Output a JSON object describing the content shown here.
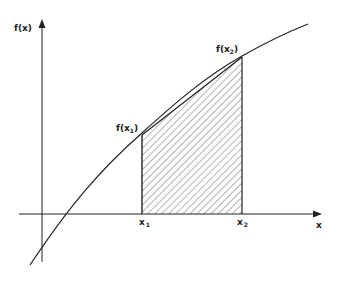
{
  "diagram": {
    "y_axis_label": "f(x)",
    "x_axis_label": "x",
    "point_labels": {
      "fx1": {
        "text": "f(x",
        "sub": "1",
        "close": ")"
      },
      "fx2": {
        "text": "f(x",
        "sub": "2",
        "close": ")"
      },
      "x1": {
        "text": "x",
        "sub": "1"
      },
      "x2": {
        "text": "x",
        "sub": "2"
      }
    },
    "colors": {
      "line": "#222222",
      "hatch": "#555555",
      "background": "#ffffff"
    }
  }
}
